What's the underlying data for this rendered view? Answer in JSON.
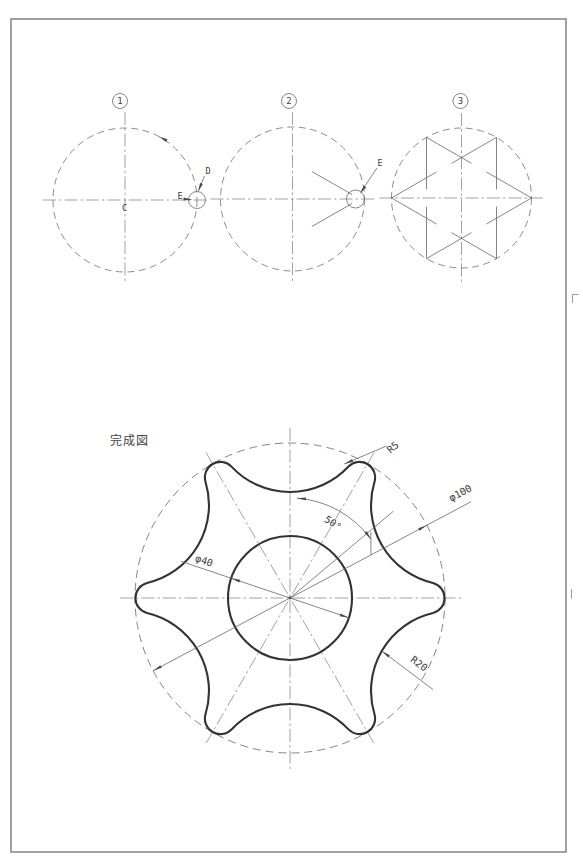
{
  "sheet": {
    "background": "#ffffff",
    "border_color": "#8a8a8a",
    "line_color": "#666666",
    "thick_line_color": "#333333",
    "text_color": "#3d3d3d"
  },
  "steps": [
    {
      "number": "1",
      "labels": {
        "center": "C",
        "small_circle": "D",
        "intersection": "E"
      }
    },
    {
      "number": "2",
      "labels": {
        "tangent_point": "E"
      }
    },
    {
      "number": "3",
      "labels": {}
    }
  ],
  "final_view": {
    "title": "完成図",
    "dimensions": {
      "tip_radius": "R5",
      "outer_diameter": "φ100",
      "bore_diameter": "φ40",
      "valley_radius": "R20",
      "lobe_angle": "50°"
    }
  }
}
